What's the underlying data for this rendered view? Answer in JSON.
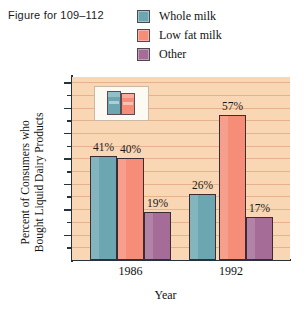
{
  "caption": "Figure for 109–112",
  "colors": {
    "whole_milk": "#6ca7b1",
    "low_fat_milk": "#f58d78",
    "other": "#a46c97",
    "plot_background": "#f9d6b4",
    "axis": "#26323c",
    "bar_outline": "#3d2b33",
    "gridline": "#d69670",
    "page_background": "#ffffff",
    "text": "#111111"
  },
  "legend": {
    "position": "top-right",
    "items": [
      {
        "label": "Whole milk",
        "color": "#6ca7b1",
        "swatch_name": "legend-swatch-whole-milk"
      },
      {
        "label": "Low fat milk",
        "color": "#f58d78",
        "swatch_name": "legend-swatch-low-fat-milk"
      },
      {
        "label": "Other",
        "color": "#a46c97",
        "swatch_name": "legend-swatch-other"
      }
    ]
  },
  "inset": {
    "name": "milk-cartons-inset",
    "cartons": [
      {
        "name": "whole-milk-carton",
        "color": "#6ca7b1"
      },
      {
        "name": "low-fat-milk-carton",
        "color": "#f58d78"
      }
    ]
  },
  "chart_data": {
    "type": "bar",
    "title": "",
    "xlabel": "Year",
    "ylabel": "Percent of Consumers who Bought Liquid Dairy Products",
    "ylabel_line1": "Percent of Consumers who",
    "ylabel_line2": "Bought Liquid Dairy Products",
    "categories": [
      "1986",
      "1992"
    ],
    "series": [
      {
        "name": "Whole milk",
        "color": "#6ca7b1",
        "values": [
          41,
          40
        ]
      },
      {
        "name": "Low fat milk",
        "color": "#f58d78",
        "values": [
          40,
          57
        ]
      },
      {
        "name": "Other",
        "color": "#a46c97",
        "values": [
          19,
          17
        ]
      }
    ],
    "bar_labels": [
      {
        "category": "1986",
        "series": "Whole milk",
        "text": "41%"
      },
      {
        "category": "1986",
        "series": "Low fat milk",
        "text": "40%"
      },
      {
        "category": "1986",
        "series": "Other",
        "text": "19%"
      },
      {
        "category": "1992",
        "series": "Whole milk",
        "text": "26%"
      },
      {
        "category": "1992",
        "series": "Low fat milk",
        "text": "57%"
      },
      {
        "category": "1992",
        "series": "Other",
        "text": "17%"
      }
    ],
    "note": "1986 Whole milk bar is drawn at 41%; 1992 Whole milk bar is drawn at 26%.",
    "drawn_values": {
      "1986": {
        "Whole milk": 41,
        "Low fat milk": 40,
        "Other": 19
      },
      "1992": {
        "Whole milk": 26,
        "Low fat milk": 57,
        "Other": 17
      }
    },
    "ylim": [
      0,
      72
    ],
    "ytick_labels": [
      "10%",
      "20%",
      "30%",
      "40%",
      "50%",
      "60%",
      "70%"
    ],
    "ytick_values": [
      10,
      20,
      30,
      40,
      50,
      60,
      70
    ],
    "yminor_values": [
      5,
      15,
      25,
      35,
      45,
      55,
      65
    ],
    "ytick_unit": "%",
    "grid": true,
    "legend_position": "top-right"
  }
}
